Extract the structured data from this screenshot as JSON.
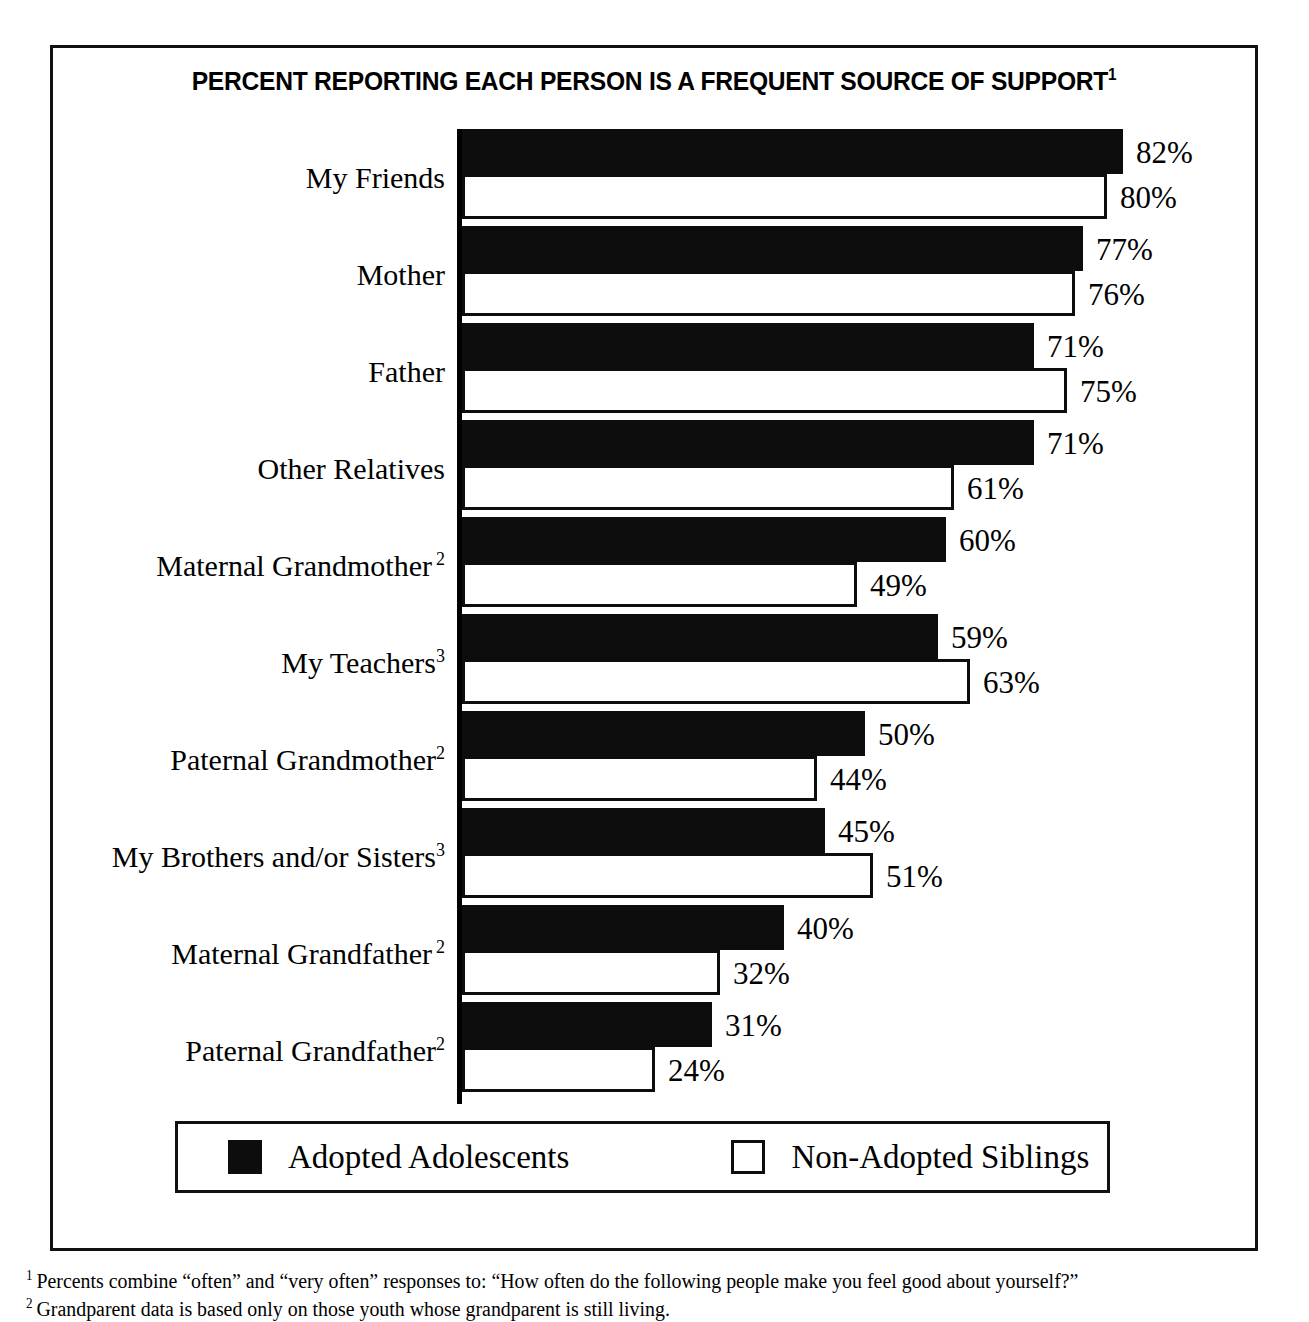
{
  "chart_data": {
    "type": "bar",
    "orientation": "horizontal",
    "title": "PERCENT REPORTING EACH PERSON IS A FREQUENT SOURCE OF SUPPORT",
    "title_footnote_marker": "1",
    "xlabel": "",
    "ylabel": "",
    "xlim": [
      0,
      82
    ],
    "grid": false,
    "axis_ticks_visible": false,
    "legend_position": "bottom",
    "categories": [
      "My Friends",
      "Mother",
      "Father",
      "Other Relatives",
      "Maternal Grandmother",
      "My Teachers",
      "Paternal Grandmother",
      "My Brothers and/or Sisters",
      "Maternal Grandfather",
      "Paternal Grandfather"
    ],
    "category_footnote_markers": [
      "",
      "",
      "",
      "",
      "2",
      "3",
      "2",
      "3",
      "2",
      "2"
    ],
    "category_marker_style": [
      "",
      "",
      "",
      "",
      "spaced",
      "tight",
      "tight",
      "tight",
      "spaced",
      "tight"
    ],
    "series": [
      {
        "name": "Adopted Adolescents",
        "style": "filled",
        "color": "#0d0d0d",
        "values": [
          82,
          77,
          71,
          71,
          60,
          59,
          50,
          45,
          40,
          31
        ],
        "labels": [
          "82%",
          "77%",
          "71%",
          "71%",
          "60%",
          "59%",
          "50%",
          "45%",
          "40%",
          "31%"
        ]
      },
      {
        "name": "Non-Adopted Siblings",
        "style": "hollow",
        "color": "#ffffff",
        "border_color": "#0d0d0d",
        "values": [
          80,
          76,
          75,
          61,
          49,
          63,
          44,
          51,
          32,
          24
        ],
        "labels": [
          "80%",
          "76%",
          "75%",
          "61%",
          "49%",
          "63%",
          "44%",
          "51%",
          "32%",
          "24%"
        ]
      }
    ]
  },
  "legend": {
    "items": [
      {
        "label": "Adopted Adolescents",
        "style": "filled"
      },
      {
        "label": "Non-Adopted Siblings",
        "style": "hollow"
      }
    ]
  },
  "footnotes": [
    {
      "marker": "1",
      "text": "Percents combine “often” and “very often” responses to: “How often do the following people make you feel good about yourself?”"
    },
    {
      "marker": "2",
      "text": "Grandparent data is based only on those youth whose grandparent is still living."
    }
  ]
}
